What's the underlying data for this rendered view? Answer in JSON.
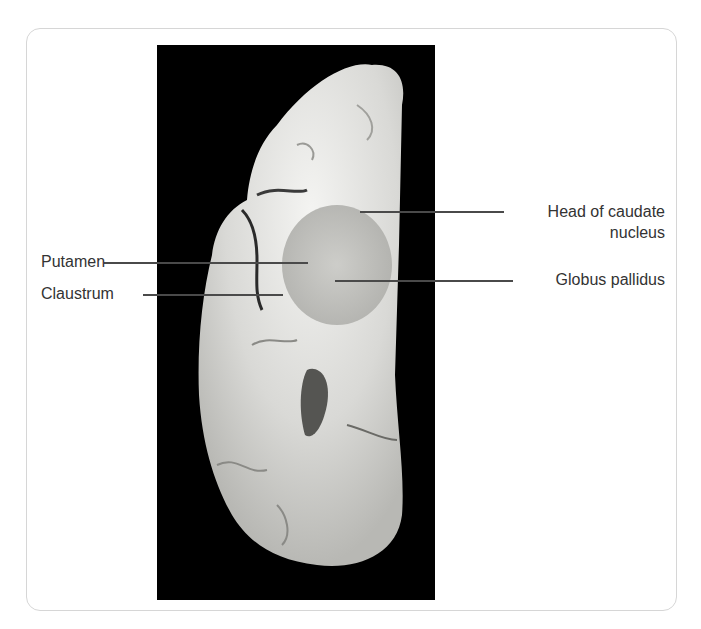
{
  "figure": {
    "type": "coronal brain section photograph",
    "background_color": "#000000",
    "frame_border_color": "#d6d6d6"
  },
  "labels": {
    "head_of_caudate_line1": "Head of caudate",
    "head_of_caudate_line2": "nucleus",
    "globus_pallidus": "Globus pallidus",
    "putamen": "Putamen",
    "claustrum": "Claustrum"
  }
}
